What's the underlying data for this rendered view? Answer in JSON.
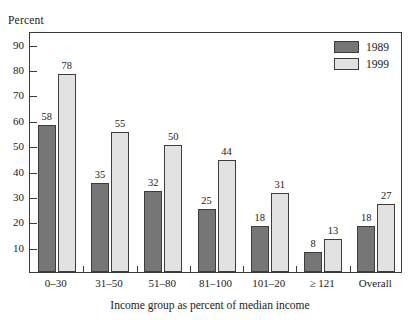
{
  "figure": {
    "cutoff_title_fragment": "",
    "y_axis_title": "Percent",
    "x_axis_title": "Income group as percent of median income"
  },
  "legend": {
    "position": "top-right",
    "entries": [
      {
        "label": "1989",
        "color": "#767676"
      },
      {
        "label": "1999",
        "color": "#e2e2e2"
      }
    ]
  },
  "chart_data": {
    "type": "bar",
    "title": "",
    "xlabel": "Income group as percent of median income",
    "ylabel": "Percent",
    "ylim": [
      0,
      95
    ],
    "yticks": [
      10,
      20,
      30,
      40,
      50,
      60,
      70,
      80,
      90
    ],
    "grid": false,
    "legend_position": "top-right",
    "categories": [
      "0–30",
      "31–50",
      "51–80",
      "81–100",
      "101–20",
      "≥ 121",
      "Overall"
    ],
    "series": [
      {
        "name": "1989",
        "color": "#767676",
        "values": [
          58,
          35,
          32,
          25,
          18,
          8,
          18
        ]
      },
      {
        "name": "1999",
        "color": "#e2e2e2",
        "values": [
          78,
          55,
          50,
          44,
          31,
          13,
          27
        ]
      }
    ]
  }
}
